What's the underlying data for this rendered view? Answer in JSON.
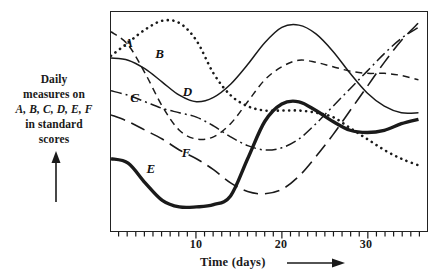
{
  "chart_data": {
    "type": "line",
    "title": "",
    "xlabel": "Time (days)",
    "ylabel": "Daily measures on A, B, C, D, E, F in standard scores",
    "xlim": [
      0,
      37
    ],
    "ylim": [
      0,
      10
    ],
    "grid": false,
    "legend": "inline-curve-labels",
    "xticks_major": [
      10,
      20,
      30
    ],
    "xticks_minor_interval": 1,
    "yticks": [],
    "x": [
      0,
      2,
      4,
      6,
      8,
      10,
      12,
      14,
      16,
      18,
      20,
      22,
      24,
      26,
      28,
      30,
      32,
      34,
      36
    ],
    "series": [
      {
        "name": "A",
        "style": "dashed",
        "label_x": 2.0,
        "label_y": 8.6,
        "values": [
          9.1,
          8.5,
          7.2,
          5.7,
          4.6,
          4.2,
          4.3,
          4.9,
          5.9,
          6.9,
          7.5,
          7.8,
          7.7,
          7.5,
          7.3,
          7.2,
          7.2,
          7.1,
          6.9
        ]
      },
      {
        "name": "B",
        "style": "dotted",
        "label_x": 5.6,
        "label_y": 8.1,
        "values": [
          8.0,
          8.6,
          9.2,
          9.6,
          9.5,
          8.7,
          7.2,
          6.2,
          5.7,
          5.5,
          5.5,
          5.5,
          5.4,
          5.2,
          4.7,
          4.2,
          3.7,
          3.3,
          3.0
        ]
      },
      {
        "name": "C",
        "style": "dash-dot",
        "label_x": 2.7,
        "label_y": 6.1,
        "values": [
          6.4,
          6.2,
          5.9,
          5.6,
          5.4,
          5.2,
          4.8,
          4.3,
          3.9,
          3.7,
          3.8,
          4.2,
          4.9,
          5.7,
          6.5,
          7.3,
          8.1,
          8.8,
          9.3
        ]
      },
      {
        "name": "D",
        "style": "solid-thin",
        "label_x": 8.8,
        "label_y": 6.4,
        "values": [
          7.9,
          7.8,
          7.4,
          6.8,
          6.2,
          5.9,
          6.1,
          6.7,
          7.6,
          8.6,
          9.3,
          9.4,
          9.0,
          8.2,
          7.2,
          6.3,
          5.7,
          5.4,
          5.4
        ]
      },
      {
        "name": "E",
        "style": "solid-thick",
        "label_x": 4.6,
        "label_y": 2.9,
        "values": [
          3.3,
          3.1,
          2.2,
          1.4,
          1.1,
          1.1,
          1.2,
          1.6,
          3.3,
          5.0,
          5.8,
          5.9,
          5.5,
          5.0,
          4.6,
          4.5,
          4.6,
          4.9,
          5.1
        ]
      },
      {
        "name": "F",
        "style": "long-dash",
        "label_x": 8.7,
        "label_y": 3.6,
        "values": [
          5.3,
          5.0,
          4.6,
          4.2,
          3.7,
          3.3,
          2.8,
          2.2,
          1.8,
          1.7,
          1.9,
          2.5,
          3.4,
          4.4,
          5.5,
          6.6,
          7.7,
          8.7,
          9.5
        ]
      }
    ]
  },
  "axis": {
    "y_caption_lines": [
      "Daily",
      "measures on",
      "A, B, C, D, E, F",
      "in standard",
      "scores"
    ],
    "x_caption": "Time  (days)",
    "x_tick_labels": [
      {
        "text": "10",
        "value": 10
      },
      {
        "text": "20",
        "value": 20
      },
      {
        "text": "30",
        "value": 30
      }
    ]
  },
  "icons": {
    "y_arrow": "arrow-up-icon",
    "x_arrow": "arrow-right-icon"
  }
}
